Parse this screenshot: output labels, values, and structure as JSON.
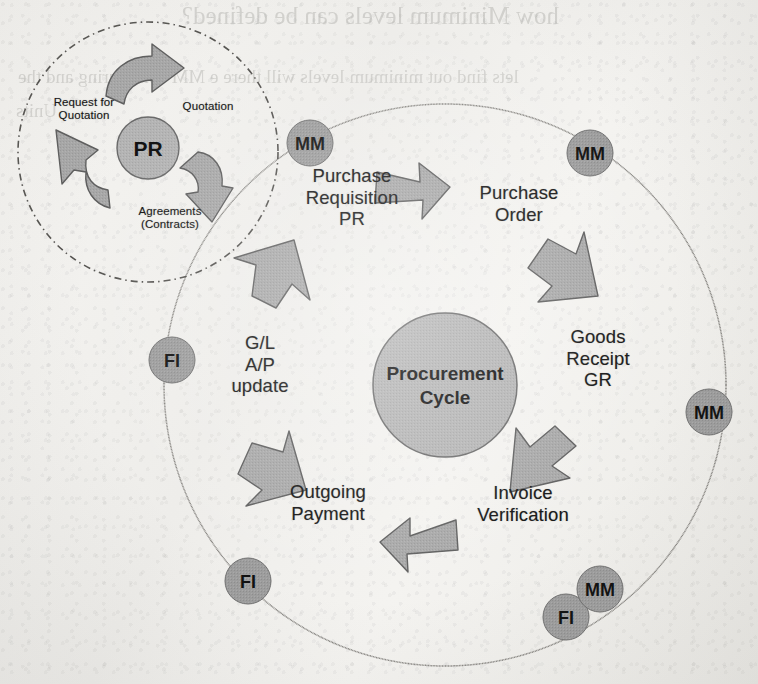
{
  "page": {
    "background_color": "#f3f2ef",
    "width": 758,
    "height": 684
  },
  "bleed_through": {
    "note": "faint mirrored text showing through from the reverse side of the scanned page",
    "lines": [
      {
        "text": "how Minimum levels can be defined?",
        "x": 182,
        "y": 2,
        "size": 25
      },
      {
        "text": "lets find out minimum levels will there e MM configuring and the",
        "x": 18,
        "y": 66,
        "size": 19
      },
      {
        "text": "Units",
        "x": 16,
        "y": 100,
        "size": 19
      }
    ]
  },
  "colors": {
    "shape_fill": "#a8a8a8",
    "shape_stroke": "#5c5c5c",
    "badge_fill": "#9d9d9d",
    "badge_stroke": "#6e6e6e",
    "center_fill": "#b3b3b3",
    "center_stroke": "#6a6a6a",
    "ring_stroke": "#7a7a7a",
    "text": "#141414"
  },
  "main_cycle": {
    "name": "Procurement Cycle",
    "center_label": "Procurement\nCycle",
    "ring": {
      "cx": 445,
      "cy": 385,
      "r": 281
    },
    "center_circle": {
      "cx": 445,
      "cy": 385,
      "r": 72
    },
    "steps": [
      {
        "id": "purchase-requisition",
        "label": "Purchase\nRequisition\nPR",
        "x": 352,
        "y": 176
      },
      {
        "id": "purchase-order",
        "label": "Purchase\nOrder",
        "x": 518,
        "y": 193
      },
      {
        "id": "goods-receipt",
        "label": "Goods\nReceipt\nGR",
        "x": 597,
        "y": 340
      },
      {
        "id": "invoice-verification",
        "label": "Invoice\nVerification",
        "x": 522,
        "y": 503
      },
      {
        "id": "outgoing-payment",
        "label": "Outgoing\nPayment",
        "x": 327,
        "y": 502
      },
      {
        "id": "gl-ap-update",
        "label": "G/L\nA/P\nupdate",
        "x": 259,
        "y": 345
      }
    ],
    "module_badges": [
      {
        "id": "badge-mm-top-left",
        "label": "MM",
        "cx": 310,
        "cy": 143,
        "r": 23
      },
      {
        "id": "badge-mm-top-right",
        "label": "MM",
        "cx": 590,
        "cy": 153,
        "r": 23
      },
      {
        "id": "badge-mm-right",
        "label": "MM",
        "cx": 709,
        "cy": 412,
        "r": 23
      },
      {
        "id": "badge-mm-bottom-right",
        "label": "MM",
        "cx": 600,
        "cy": 589,
        "r": 23
      },
      {
        "id": "badge-fi-bottom-right",
        "label": "FI",
        "cx": 566,
        "cy": 617,
        "r": 23
      },
      {
        "id": "badge-fi-bottom-left",
        "label": "FI",
        "cx": 248,
        "cy": 581,
        "r": 23
      },
      {
        "id": "badge-fi-left",
        "label": "FI",
        "cx": 172,
        "cy": 360,
        "r": 23
      }
    ]
  },
  "pr_cycle": {
    "name": "Purchase Requisition sub-cycle",
    "center_label": "PR",
    "dash_circle": {
      "cx": 148,
      "cy": 152,
      "r": 130
    },
    "center_circle": {
      "cx": 148,
      "cy": 148,
      "r": 30
    },
    "steps": [
      {
        "id": "request-for-quotation",
        "label": "Request for\nQuotation",
        "x": 83,
        "y": 104
      },
      {
        "id": "quotation",
        "label": "Quotation",
        "x": 208,
        "y": 110
      },
      {
        "id": "agreements-contracts",
        "label": "Agreements\n(Contracts)",
        "x": 170,
        "y": 213
      }
    ]
  }
}
